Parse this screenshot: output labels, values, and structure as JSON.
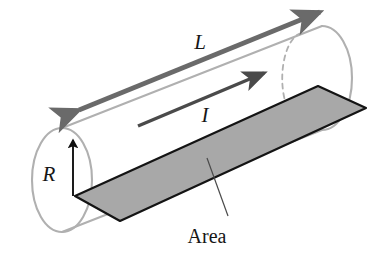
{
  "figure": {
    "kind": "cylinder-conductor-diagram",
    "background_color": "#ffffff",
    "labels": {
      "length": "L",
      "current": "I",
      "radius": "R",
      "area": "Area"
    },
    "colors": {
      "cylinder_outline": "#b0b0b0",
      "hidden_edge_dashed": "#b0b0b0",
      "area_fill": "#a8a8a8",
      "area_stroke": "#141414",
      "length_arrow": "#6a6a6a",
      "current_arrow": "#4a4a4a",
      "radius_arrow": "#111111",
      "leader_line": "#4a4a4a",
      "label_text": "#161616"
    },
    "geometry": {
      "cylinder": {
        "left_cap_center_x": 62,
        "left_cap_center_y": 180,
        "left_cap_rx": 30,
        "left_cap_ry": 52,
        "right_cap_center_x": 322,
        "right_cap_center_y": 78,
        "right_cap_rx": 30,
        "right_cap_ry": 52,
        "axis_angle_deg": -21.4
      },
      "area_parallelogram": [
        [
          75,
          196
        ],
        [
          120,
          221
        ],
        [
          366,
          108
        ],
        [
          318,
          86
        ]
      ],
      "length_arrow": {
        "from_x": 79,
        "from_y": 110,
        "to_x": 320,
        "to_y": 12,
        "double_headed": true
      },
      "current_arrow": {
        "from_x": 138,
        "from_y": 126,
        "to_x": 266,
        "to_y": 72,
        "double_headed": false
      },
      "radius_arrow": {
        "from_x": 73,
        "from_y": 196,
        "to_x": 73,
        "to_y": 137
      },
      "area_leader": {
        "from_x": 207,
        "from_y": 158,
        "to_x": 228,
        "to_y": 214
      },
      "label_positions": {
        "length": {
          "x": 200,
          "y": 49
        },
        "current": {
          "x": 205,
          "y": 122
        },
        "radius": {
          "x": 49,
          "y": 180
        },
        "area": {
          "x": 205,
          "y": 240
        }
      }
    }
  }
}
